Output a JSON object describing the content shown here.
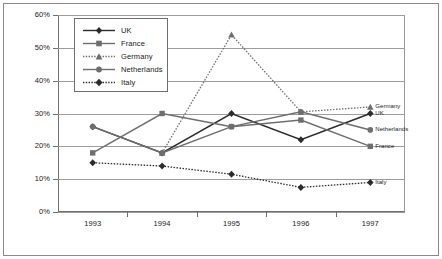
{
  "chart_data": {
    "type": "line",
    "title": "",
    "xlabel": "",
    "ylabel": "",
    "categories": [
      "1993",
      "1994",
      "1995",
      "1996",
      "1997"
    ],
    "ylim": [
      0,
      60
    ],
    "ytick_values": [
      0,
      10,
      20,
      30,
      40,
      50,
      60
    ],
    "ytick_labels": [
      "0%",
      "10%",
      "20%",
      "30%",
      "40%",
      "50%",
      "60%"
    ],
    "grid": true,
    "legend_position": "upper-left-inside",
    "series": [
      {
        "name": "UK",
        "values": [
          26,
          18,
          30,
          22,
          30
        ],
        "marker": "diamond",
        "line_style": "solid",
        "color": "#2b2b2b",
        "end_label": "UK"
      },
      {
        "name": "France",
        "values": [
          18,
          30,
          26,
          28,
          20
        ],
        "marker": "square",
        "line_style": "solid",
        "color": "#6e6e6e",
        "end_label": "France"
      },
      {
        "name": "Germany",
        "values": [
          null,
          18,
          54,
          30.5,
          32
        ],
        "marker": "triangle",
        "line_style": "dotted",
        "color": "#6e6e6e",
        "end_label": "Germany"
      },
      {
        "name": "Netherlands",
        "values": [
          26,
          18,
          26,
          30.5,
          25
        ],
        "marker": "circle",
        "line_style": "solid",
        "color": "#6e6e6e",
        "end_label": "Netherlands"
      },
      {
        "name": "Italy",
        "values": [
          15,
          14,
          11.5,
          7.5,
          9
        ],
        "marker": "diamond",
        "line_style": "dotted",
        "color": "#2b2b2b",
        "end_label": "Italy"
      }
    ]
  },
  "legend": {
    "items": [
      {
        "label": "UK"
      },
      {
        "label": "France"
      },
      {
        "label": "Germany"
      },
      {
        "label": "Netherlands"
      },
      {
        "label": "Italy"
      }
    ]
  }
}
